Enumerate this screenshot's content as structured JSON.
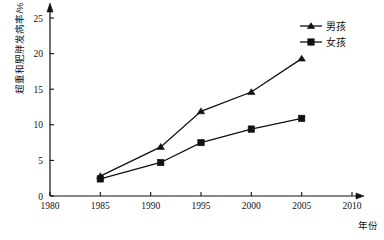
{
  "chart_data": {
    "type": "line",
    "title": "",
    "xlabel": "年份",
    "ylabel": "超重和肥胖发病率/%",
    "xlim": [
      1980,
      2010
    ],
    "ylim": [
      0,
      25
    ],
    "xticks": [
      1980,
      1985,
      1990,
      1995,
      2000,
      2005,
      2010
    ],
    "yticks": [
      0,
      5,
      10,
      15,
      20,
      25
    ],
    "grid": false,
    "legend_position": "top-right",
    "x": [
      1985,
      1991,
      1995,
      2000,
      2005
    ],
    "series": [
      {
        "name": "男孩",
        "marker": "triangle",
        "color": "#111111",
        "values": [
          2.8,
          6.9,
          11.9,
          14.6,
          19.3
        ]
      },
      {
        "name": "女孩",
        "marker": "square",
        "color": "#111111",
        "values": [
          2.4,
          4.7,
          7.5,
          9.4,
          10.9
        ]
      }
    ]
  },
  "axes": {
    "x_tick_labels": [
      "1980",
      "1985",
      "1990",
      "1995",
      "2000",
      "2005",
      "2010"
    ],
    "y_tick_labels": [
      "0",
      "5",
      "10",
      "15",
      "20",
      "25"
    ],
    "x_axis_title": "年份",
    "y_axis_title": "超重和肥胖发病率/%"
  },
  "legend": {
    "entries": [
      {
        "label": "男孩",
        "marker": "triangle-marker-icon"
      },
      {
        "label": "女孩",
        "marker": "square-marker-icon"
      }
    ]
  }
}
